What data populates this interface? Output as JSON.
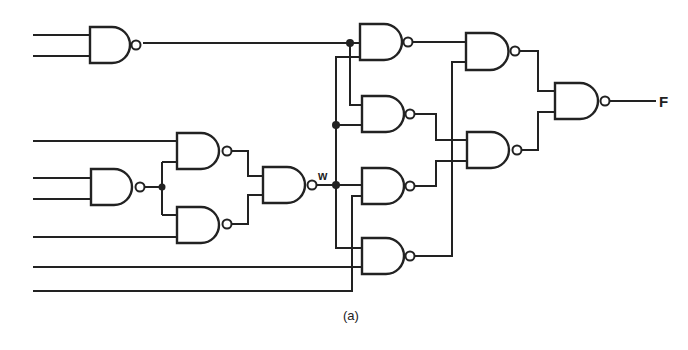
{
  "figure": {
    "caption": "(a)",
    "signal_labels": {
      "w": "w",
      "output": "F"
    },
    "gate_type": "NAND",
    "gates": [
      {
        "id": "G1",
        "x": 90,
        "y": 27,
        "w": 40,
        "h": 36
      },
      {
        "id": "G2",
        "x": 360,
        "y": 24,
        "w": 40,
        "h": 36
      },
      {
        "id": "G3",
        "x": 362,
        "y": 96,
        "w": 40,
        "h": 36
      },
      {
        "id": "G4",
        "x": 362,
        "y": 168,
        "w": 40,
        "h": 36
      },
      {
        "id": "G5",
        "x": 362,
        "y": 238,
        "w": 40,
        "h": 36
      },
      {
        "id": "G6",
        "x": 177,
        "y": 133,
        "w": 40,
        "h": 36
      },
      {
        "id": "G7",
        "x": 177,
        "y": 207,
        "w": 40,
        "h": 36
      },
      {
        "id": "G8",
        "x": 91,
        "y": 169,
        "w": 40,
        "h": 36
      },
      {
        "id": "G9",
        "x": 263,
        "y": 167,
        "w": 40,
        "h": 36
      },
      {
        "id": "G10",
        "x": 466,
        "y": 33,
        "w": 40,
        "h": 37
      },
      {
        "id": "G11",
        "x": 467,
        "y": 132,
        "w": 40,
        "h": 36
      },
      {
        "id": "G12",
        "x": 555,
        "y": 83,
        "w": 42,
        "h": 36
      }
    ],
    "primary_inputs_count": 8,
    "junction_dots": 4
  }
}
